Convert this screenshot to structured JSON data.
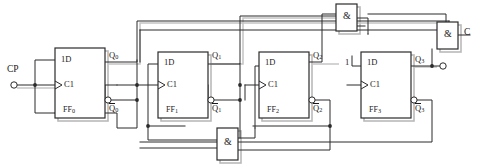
{
  "diagram": {
    "stroke_color": "#2b2b2b",
    "shadow_color": "#b9b9b9",
    "background": "#ffffff"
  },
  "inputs": {
    "clock": {
      "label": "CP",
      "terminal": "open-circle"
    },
    "enable": {
      "label": "1"
    }
  },
  "outputs": {
    "carry": {
      "label": "C",
      "terminal": "open-circle"
    },
    "q3_terminal": {
      "terminal": "open-circle"
    }
  },
  "flipflops": [
    {
      "name": "FF0",
      "name_text": "FF",
      "index": "0",
      "d_label": "1D",
      "clk_label": "C1",
      "q_label": "Q",
      "q_sub": "0",
      "qbar_label": "Q",
      "qbar_sub": "0",
      "x": 55,
      "y": 48,
      "w": 50,
      "h": 70
    },
    {
      "name": "FF1",
      "name_text": "FF",
      "index": "1",
      "d_label": "1D",
      "clk_label": "C1",
      "q_label": "Q",
      "q_sub": "1",
      "qbar_label": "Q",
      "qbar_sub": "1",
      "x": 158,
      "y": 52,
      "w": 50,
      "h": 66
    },
    {
      "name": "FF2",
      "name_text": "FF",
      "index": "2",
      "d_label": "1D",
      "clk_label": "C1",
      "q_label": "Q",
      "q_sub": "2",
      "qbar_label": "Q",
      "qbar_sub": "2",
      "x": 259,
      "y": 52,
      "w": 50,
      "h": 66
    },
    {
      "name": "FF3",
      "name_text": "FF",
      "index": "3",
      "d_label": "1D",
      "clk_label": "C1",
      "q_label": "Q",
      "q_sub": "3",
      "qbar_label": "Q",
      "qbar_sub": "3",
      "x": 361,
      "y": 52,
      "w": 50,
      "h": 66
    }
  ],
  "gates": [
    {
      "id": "and-top",
      "symbol": "&",
      "x": 336,
      "y": 4,
      "w": 21,
      "h": 27
    },
    {
      "id": "and-right",
      "symbol": "&",
      "x": 437,
      "y": 22,
      "w": 21,
      "h": 27
    },
    {
      "id": "and-bottom",
      "symbol": "&",
      "x": 217,
      "y": 128,
      "w": 21,
      "h": 32
    }
  ]
}
